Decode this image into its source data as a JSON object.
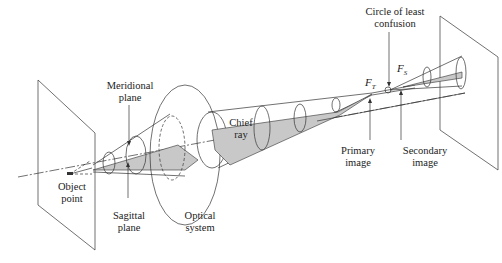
{
  "diagram": {
    "colors": {
      "line": "#333333",
      "fill": "#c8c8c8",
      "background": "#ffffff"
    },
    "labels": {
      "meridional_plane": "Meridional\nplane",
      "object_point": "Object\npoint",
      "sagittal_plane": "Sagittal\nplane",
      "optical_system": "Optical\nsystem",
      "chief_ray": "Chief\nray",
      "primary_image": "Primary\nimage",
      "secondary_image": "Secondary\nimage",
      "circle_of_least_confusion": "Circle of least\nconfusion",
      "f_t": {
        "base": "F",
        "sub": "T"
      },
      "f_s": {
        "base": "F",
        "sub": "S"
      }
    }
  }
}
